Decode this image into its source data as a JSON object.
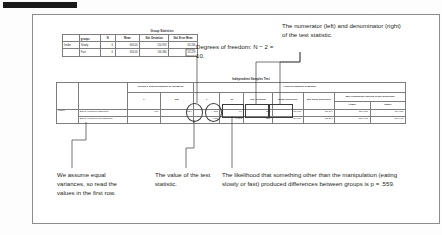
{
  "figure": {
    "group_stats": {
      "title": "Group Statistics",
      "corner_label": "groups",
      "row_var": "Intake",
      "headers": [
        "",
        "groups",
        "N",
        "Mean",
        "Std. Deviation",
        "Std. Error Mean"
      ],
      "rows": [
        {
          "var": "Intake",
          "group": "Slowly",
          "n": "6",
          "mean": "600.00",
          "sd": "154.919",
          "sem": "63.246"
        },
        {
          "var": "",
          "group": "Fast",
          "n": "6",
          "mean": "650.00",
          "sd": "130.384",
          "sem": "53.229"
        }
      ]
    },
    "independent_samples_test": {
      "title": "Independent Samples Test",
      "levene_header": "Levene's Test for Equality of Variances",
      "ttest_header": "t-test for Equality of Means",
      "ci_header": "95% Confidence Interval of the Difference",
      "col_f": "F",
      "col_sig": "Sig.",
      "col_t": "t",
      "col_df": "df",
      "col_sig2": "Sig. (2-tailed)",
      "col_meandiff": "Mean Difference",
      "col_sediff": "Std. Error Difference",
      "col_lower": "Lower",
      "col_upper": "Upper",
      "row_var": "Intake",
      "rows": [
        {
          "label": "Equal variances assumed",
          "f": ".134",
          "sig": ".724",
          "t": "-.605",
          "df": "10",
          "sig2": ".559",
          "meandiff": "-50.000",
          "sediff": "82.664",
          "lower": "-234.187",
          "upper": "134.187"
        },
        {
          "label": "Equal variances not assumed",
          "f": "",
          "sig": "",
          "t": "-.605",
          "df": "9.717",
          "sig2": ".559",
          "meandiff": "-50.000",
          "sediff": "82.664",
          "lower": "-234.917",
          "upper": "134.917"
        }
      ]
    },
    "annotations": {
      "degrees_of_freedom": "Degrees of freedom: N − 2 = 10.",
      "numerator_denominator": "The numerator (left) and denominator (right) of the test statistic.",
      "equal_variances": "We assume equal variances, so read the values in the first row.",
      "test_statistic": "The value of the test statistic.",
      "p_value": "The likelihood that something other than the manipulation (eating slowly or fast) produced differences between groups is p = .559."
    }
  },
  "colors": {
    "rule": "#1a1a1a",
    "frame": "#8c8c8c",
    "callout": "#3b3b3b",
    "text": "#231f20"
  }
}
